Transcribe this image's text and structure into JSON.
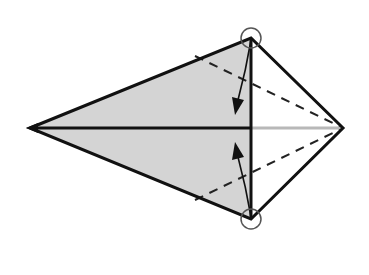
{
  "diagram": {
    "type": "origami-fold-step",
    "colors": {
      "background": "#ffffff",
      "paper_shaded": "#d4d4d4",
      "paper_white": "#ffffff",
      "outline": "#111111",
      "center_line_right": "#b8b8b8",
      "circle": "#555555"
    },
    "points": {
      "left_tip": [
        30,
        128
      ],
      "top_corner": [
        251,
        38
      ],
      "bottom_corner": [
        251,
        219
      ],
      "right_tip": [
        343,
        128
      ]
    },
    "annotations": [
      {
        "name": "top-corner-marker",
        "kind": "circle",
        "cx": 251,
        "cy": 38,
        "r": 10
      },
      {
        "name": "bottom-corner-marker",
        "kind": "circle",
        "cx": 251,
        "cy": 219,
        "r": 10
      },
      {
        "name": "fold-arrow-top",
        "kind": "arrow",
        "from": [
          251,
          40
        ],
        "to": [
          236,
          113
        ]
      },
      {
        "name": "fold-arrow-bottom",
        "kind": "arrow",
        "from": [
          251,
          217
        ],
        "to": [
          236,
          142
        ]
      }
    ],
    "fold_lines": [
      {
        "name": "valley-fold-upper",
        "style": "dashed",
        "from": [
          195,
          56
        ],
        "to": [
          343,
          128
        ]
      },
      {
        "name": "valley-fold-lower",
        "style": "dashed",
        "from": [
          195,
          200
        ],
        "to": [
          343,
          128
        ]
      }
    ]
  }
}
